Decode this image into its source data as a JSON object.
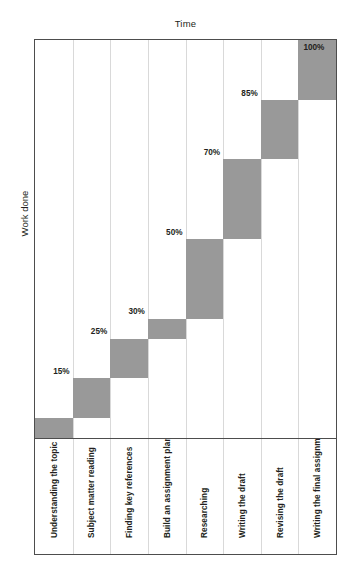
{
  "chart_data": {
    "type": "bar",
    "title": "",
    "xlabel": "Time",
    "ylabel": "Work done",
    "ylim": [
      0,
      100
    ],
    "grid": "vertical",
    "legend": "none",
    "bar_color": "#999999",
    "frame_color": "#4d4d4d",
    "gridline_color": "#d9d9d9",
    "categories": [
      "Understanding the topic",
      "Subject matter reading",
      "Finding key references",
      "Build an assignment plan",
      "Researching",
      "Writing the draft",
      "Revising the draft",
      "Writing the final assignment"
    ],
    "cumulative_values": [
      5,
      15,
      25,
      30,
      50,
      70,
      85,
      100
    ],
    "value_labels": [
      "5%",
      "15%",
      "25%",
      "30%",
      "50%",
      "70%",
      "85%",
      "100%"
    ],
    "segments": [
      {
        "label": "5%",
        "start": 0,
        "end": 5
      },
      {
        "label": "15%",
        "start": 5,
        "end": 15
      },
      {
        "label": "25%",
        "start": 15,
        "end": 25
      },
      {
        "label": "30%",
        "start": 25,
        "end": 30
      },
      {
        "label": "50%",
        "start": 30,
        "end": 50
      },
      {
        "label": "70%",
        "start": 50,
        "end": 70
      },
      {
        "label": "85%",
        "start": 70,
        "end": 85
      },
      {
        "label": "100%",
        "start": 85,
        "end": 100
      }
    ]
  }
}
